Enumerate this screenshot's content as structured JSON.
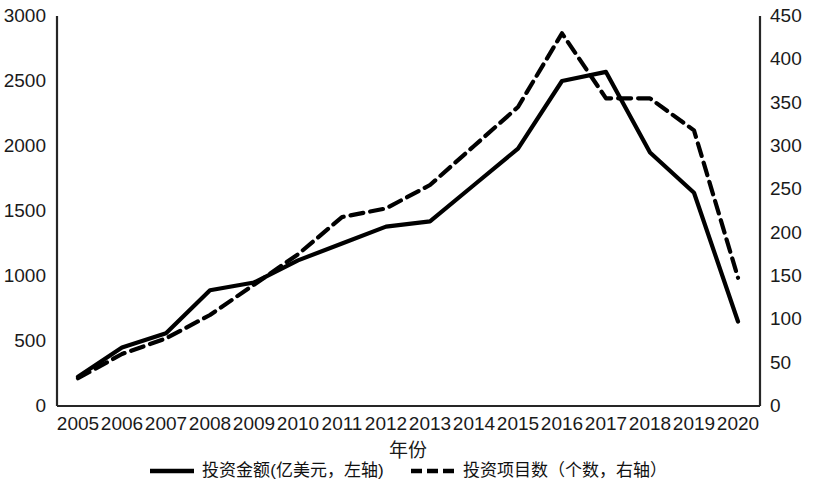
{
  "chart_data": {
    "type": "line",
    "title": "",
    "xlabel": "年份",
    "ylabel": "",
    "x": [
      2005,
      2006,
      2007,
      2008,
      2009,
      2010,
      2011,
      2012,
      2013,
      2014,
      2015,
      2016,
      2017,
      2018,
      2019,
      2020
    ],
    "categories": [
      "2005",
      "2006",
      "2007",
      "2008",
      "2009",
      "2010",
      "2011",
      "2012",
      "2013",
      "2014",
      "2015",
      "2016",
      "2017",
      "2018",
      "2019",
      "2020"
    ],
    "series": [
      {
        "name": "投资金额(亿美元，左轴)",
        "axis": "left",
        "style": "solid",
        "color": "#000000",
        "values": [
          225,
          450,
          560,
          890,
          950,
          1120,
          1250,
          1380,
          1420,
          1700,
          1980,
          2500,
          2570,
          1950,
          1640,
          650
        ]
      },
      {
        "name": "投资项目数（个数，右轴）",
        "axis": "right",
        "style": "dashed",
        "color": "#000000",
        "values": [
          32,
          60,
          78,
          105,
          140,
          175,
          218,
          228,
          255,
          300,
          345,
          430,
          355,
          355,
          318,
          148
        ]
      }
    ],
    "left_axis": {
      "label": "",
      "ylim": [
        0,
        3000
      ],
      "ticks": [
        0,
        500,
        1000,
        1500,
        2000,
        2500,
        3000
      ],
      "tick_labels": [
        "0",
        "500",
        "1000",
        "1500",
        "2000",
        "2500",
        "3000"
      ]
    },
    "right_axis": {
      "label": "",
      "ylim": [
        0,
        450
      ],
      "ticks": [
        0,
        50,
        100,
        150,
        200,
        250,
        300,
        350,
        400,
        450
      ],
      "tick_labels": [
        "0",
        "50",
        "100",
        "150",
        "200",
        "250",
        "300",
        "350",
        "400",
        "450"
      ]
    },
    "grid": false,
    "legend_position": "bottom"
  },
  "legend": {
    "items": [
      {
        "label": "投资金额(亿美元，左轴)",
        "style": "solid"
      },
      {
        "label": "投资项目数（个数，右轴）",
        "style": "dashed"
      }
    ]
  },
  "axis_titles": {
    "x": "年份"
  },
  "colors": {
    "line": "#000000",
    "axis": "#262626",
    "background": "#ffffff",
    "text": "#1a1a1a"
  }
}
